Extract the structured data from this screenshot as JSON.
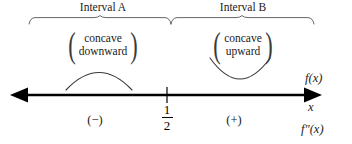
{
  "diagram": {
    "type": "sign-chart-number-line",
    "title_hidden": true,
    "intervals": [
      {
        "id": "A",
        "label": "Interval A",
        "concavity_line1": "concave",
        "concavity_line2": "downward",
        "sign": "(−)",
        "curve": "concave-down-arc"
      },
      {
        "id": "B",
        "label": "Interval B",
        "concavity_line1": "concave",
        "concavity_line2": "upward",
        "sign": "(+)",
        "curve": "concave-up-arc"
      }
    ],
    "critical_point": {
      "numerator": "1",
      "denominator": "2",
      "value": "1/2"
    },
    "axis": {
      "function_label": "f(x)",
      "variable_label": "x",
      "second_derivative_label": "f″(x)",
      "left_arrow": true,
      "right_arrow": true
    },
    "colors": {
      "ink": "#000000",
      "text": "#1a1a1a",
      "thin_line": "#555555",
      "background": "#ffffff"
    }
  }
}
